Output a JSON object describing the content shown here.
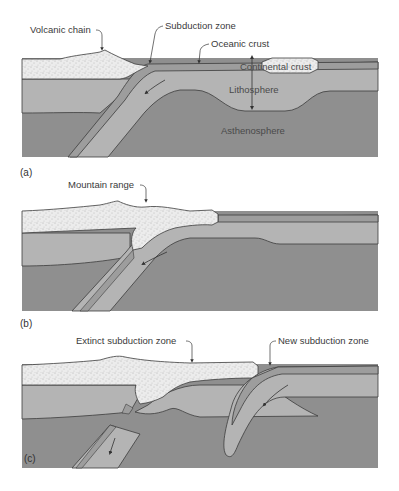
{
  "figure": {
    "panels": [
      {
        "id": "a",
        "label": "(a)",
        "annotations": {
          "volcanic_chain": "Volcanic chain",
          "subduction_zone": "Subduction zone",
          "oceanic_crust": "Oceanic crust",
          "continental_crust": "Continental crust",
          "lithosphere": "Lithosphere",
          "asthenosphere": "Asthenosphere"
        }
      },
      {
        "id": "b",
        "label": "(b)",
        "annotations": {
          "mountain_range": "Mountain range"
        }
      },
      {
        "id": "c",
        "label": "(c)",
        "annotations": {
          "extinct_subduction_zone": "Extinct subduction zone",
          "new_subduction_zone": "New subduction zone"
        }
      }
    ],
    "colors": {
      "background": "#ffffff",
      "asthenosphere": "#8f8f8f",
      "lithosphere": "#b4b4b4",
      "oceanic_crust": "#9d9d9d",
      "continental_crust": "#e6e6e6",
      "outline": "#3c3c3c"
    }
  }
}
